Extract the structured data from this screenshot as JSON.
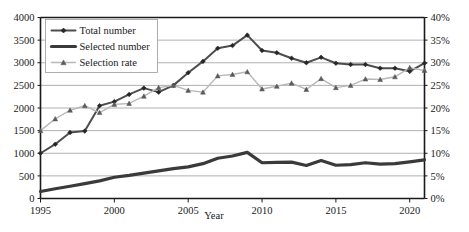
{
  "chart_data": {
    "type": "line",
    "title": "",
    "xlabel": "Year",
    "ylabel": "",
    "y2label": "",
    "grid": true,
    "legend_position": "top-left",
    "x": [
      1995,
      1996,
      1997,
      1998,
      1999,
      2000,
      2001,
      2002,
      2003,
      2004,
      2005,
      2006,
      2007,
      2008,
      2009,
      2010,
      2011,
      2012,
      2013,
      2014,
      2015,
      2016,
      2017,
      2018,
      2019,
      2020,
      2021
    ],
    "xlim": [
      1995,
      2021
    ],
    "xticks": [
      1995,
      2000,
      2005,
      2010,
      2015,
      2020
    ],
    "xticklabels": [
      "1995",
      "2000",
      "2005",
      "2010",
      "2015",
      "2020"
    ],
    "ylim": [
      0,
      4000
    ],
    "yticks": [
      0,
      500,
      1000,
      1500,
      2000,
      2500,
      3000,
      3500,
      4000
    ],
    "yticklabels": [
      "0",
      "500",
      "1000",
      "1500",
      "2000",
      "2500",
      "3000",
      "3500",
      "4000"
    ],
    "y2lim": [
      0,
      40
    ],
    "y2ticks": [
      0,
      5,
      10,
      15,
      20,
      25,
      30,
      35,
      40
    ],
    "y2ticklabels": [
      "0%",
      "5%",
      "10%",
      "15%",
      "20%",
      "25%",
      "30%",
      "35%",
      "40%"
    ],
    "series": [
      {
        "name": "Total number",
        "axis": "left",
        "color": "#4d4d4d",
        "marker": "diamond",
        "width": 2.0,
        "values": [
          1000,
          1200,
          1460,
          1490,
          2050,
          2140,
          2300,
          2440,
          2350,
          2500,
          2780,
          3030,
          3320,
          3380,
          3610,
          3270,
          3220,
          3100,
          3000,
          3120,
          2990,
          2960,
          2960,
          2880,
          2880,
          2810,
          2990
        ]
      },
      {
        "name": "Selected number",
        "axis": "left",
        "color": "#3a3a3a",
        "marker": "none",
        "width": 3.2,
        "values": [
          155,
          215,
          270,
          330,
          390,
          470,
          510,
          560,
          610,
          660,
          700,
          770,
          890,
          940,
          1020,
          790,
          800,
          805,
          730,
          840,
          735,
          750,
          790,
          760,
          770,
          810,
          855
        ]
      },
      {
        "name": "Selection rate",
        "axis": "right",
        "color": "#b8b8b8",
        "marker": "triangle",
        "width": 1.4,
        "values": [
          15.0,
          17.6,
          19.5,
          20.5,
          19.0,
          20.8,
          21.0,
          22.6,
          24.5,
          25.0,
          23.9,
          23.5,
          27.1,
          27.4,
          28.0,
          24.2,
          24.8,
          25.5,
          24.1,
          26.5,
          24.5,
          25.0,
          26.4,
          26.3,
          26.9,
          28.9,
          28.3
        ]
      }
    ]
  },
  "legend": {
    "items": [
      {
        "label": "Total number"
      },
      {
        "label": "Selected number"
      },
      {
        "label": "Selection rate"
      }
    ]
  }
}
